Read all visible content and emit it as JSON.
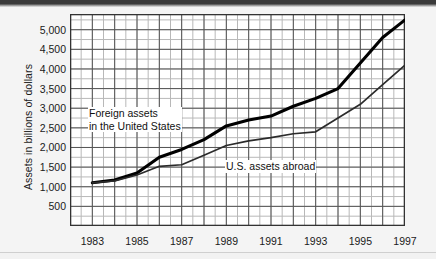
{
  "chart_data": {
    "type": "line",
    "title": "",
    "xlabel": "",
    "ylabel": "Assets in billions of dollars",
    "xlim": [
      1982,
      1997
    ],
    "ylim": [
      0,
      5400
    ],
    "grid": true,
    "grid_major_y_step": 500,
    "grid_minor_y_step": 250,
    "grid_major_x_step": 1,
    "grid_minor_x_step": 0.5,
    "legend_position": "inline-annotations",
    "x": [
      1983,
      1984,
      1985,
      1986,
      1987,
      1988,
      1989,
      1990,
      1991,
      1992,
      1993,
      1994,
      1995,
      1996,
      1997
    ],
    "series": [
      {
        "name": "Foreign assets in the United States",
        "style": "thick-black",
        "values": [
          1100,
          1170,
          1350,
          1750,
          1950,
          2200,
          2550,
          2700,
          2800,
          3050,
          3250,
          3500,
          4150,
          4800,
          5250
        ]
      },
      {
        "name": "U.S. assets abroad",
        "style": "thin-black",
        "values": [
          1100,
          1150,
          1300,
          1520,
          1560,
          1800,
          2050,
          2170,
          2250,
          2350,
          2400,
          2750,
          3100,
          3600,
          4100
        ]
      }
    ],
    "ytick_labels": [
      "5,000",
      "4,500",
      "4,000",
      "3,500",
      "3,000",
      "2,500",
      "2,000",
      "1,500",
      "1,000",
      "500"
    ],
    "ytick_values": [
      5000,
      4500,
      4000,
      3500,
      3000,
      2500,
      2000,
      1500,
      1000,
      500
    ],
    "xtick_labels": [
      "1983",
      "1985",
      "1987",
      "1989",
      "1991",
      "1993",
      "1995",
      "1997"
    ],
    "xtick_values": [
      1983,
      1985,
      1987,
      1989,
      1991,
      1993,
      1995,
      1997
    ],
    "annotations": [
      {
        "id": "foreign",
        "line1": "Foreign assets",
        "line2": "in the United States"
      },
      {
        "id": "usa",
        "line1": "U.S. assets abroad",
        "line2": ""
      }
    ],
    "colors": {
      "series_foreign": "#000000",
      "series_usa": "#262626",
      "grid_major": "#555555",
      "grid_minor": "#b8b8b8",
      "frame": "#333333",
      "plot_background": "#ffffff",
      "page_background": "#f2f2f2",
      "top_band": "#3a3a3a"
    }
  }
}
